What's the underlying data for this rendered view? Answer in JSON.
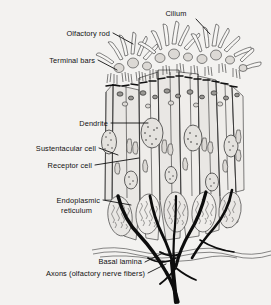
{
  "figure": {
    "background_color": "#f3f2f0",
    "ink_color": "#1a1a1a"
  },
  "labels": [
    {
      "id": "cilium",
      "text": "Cilium",
      "x": 176,
      "y": 16,
      "anchor": "middle"
    },
    {
      "id": "olfactory-rod",
      "text": "Olfactory rod",
      "x": 110,
      "y": 36,
      "anchor": "end"
    },
    {
      "id": "terminal-bars",
      "text": "Terminal bars",
      "x": 95,
      "y": 63,
      "anchor": "end"
    },
    {
      "id": "dendrite",
      "text": "Dendrite",
      "x": 108,
      "y": 126,
      "anchor": "end"
    },
    {
      "id": "sustentacular-cell",
      "text": "Sustentacular cell",
      "x": 96,
      "y": 151,
      "anchor": "end"
    },
    {
      "id": "receptor-cell",
      "text": "Receptor cell",
      "x": 92,
      "y": 168,
      "anchor": "end"
    },
    {
      "id": "endoplasmic-1",
      "text": "Endoplasmic",
      "x": 100,
      "y": 203,
      "anchor": "end"
    },
    {
      "id": "endoplasmic-2",
      "text": "reticulum",
      "x": 92,
      "y": 213,
      "anchor": "end"
    },
    {
      "id": "basal-lamina",
      "text": "Basal lamina",
      "x": 142,
      "y": 264,
      "anchor": "end"
    },
    {
      "id": "axons",
      "text": "Axons (olfactory nerve fibers)",
      "x": 145,
      "y": 276,
      "anchor": "end"
    }
  ],
  "leaders": [
    {
      "id": "leader-cilium",
      "d": "M 196 19 L 210 34"
    },
    {
      "id": "leader-olfactory-rod",
      "d": "M 113 33 L 133 44"
    },
    {
      "id": "leader-terminal-bars",
      "d": "M 98 60 L 117 70"
    },
    {
      "id": "leader-dendrite",
      "d": "M 111 123 L 148 123"
    },
    {
      "id": "leader-sustentacular",
      "d": "M 99 148 L 118 155"
    },
    {
      "id": "leader-receptor",
      "d": "M 95 165 L 139 158"
    },
    {
      "id": "leader-endoplasmic",
      "d": "M 103 200 L 131 205"
    },
    {
      "id": "leader-basal-lamina",
      "d": "M 145 262 L 163 253"
    },
    {
      "id": "leader-axons",
      "d": "M 148 273 L 166 264"
    }
  ],
  "structures": {
    "cilia_count": 34,
    "cell_columns": 6,
    "axon_bundle": "converging dark fibers below basal lamina",
    "basal_lamina": "wavy horizontal double line at y≈255"
  }
}
